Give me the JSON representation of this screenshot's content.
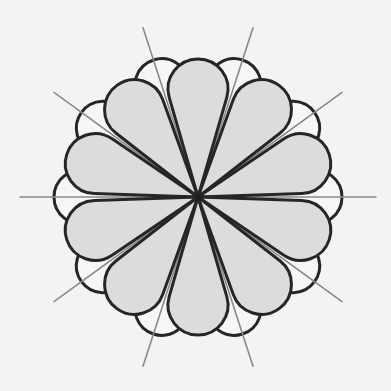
{
  "figure": {
    "center": [
      198,
      197
    ],
    "colors": {
      "background": "#f3f3f1",
      "gray_petal_fill": "#dcdcda",
      "white_petal_fill": "#f6f6f4",
      "outline": "#262626",
      "ray": "#8a8a8a"
    },
    "gray_petals": {
      "count": 10,
      "angles_deg": [
        18,
        54,
        90,
        126,
        162,
        198,
        234,
        270,
        306,
        342
      ],
      "length": 138,
      "cap_radius": 30
    },
    "white_petals": {
      "count": 10,
      "angles_deg": [
        0,
        36,
        72,
        108,
        144,
        180,
        216,
        252,
        288,
        324
      ],
      "length": 144,
      "cap_radius": 27
    },
    "rays": {
      "count": 10,
      "angles_deg": [
        0,
        36,
        72,
        108,
        144,
        180,
        216,
        252,
        288,
        324
      ],
      "length": 178
    }
  }
}
